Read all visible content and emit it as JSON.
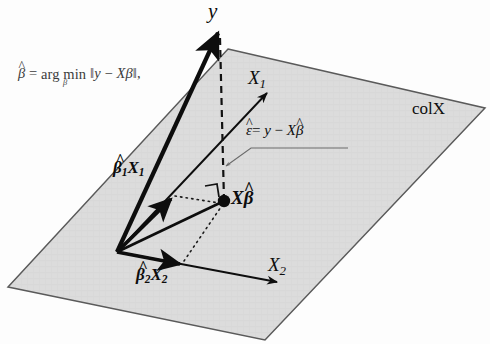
{
  "figure": {
    "background_color": "#fdfdfd",
    "plane_fill": "#dcdcdc",
    "plane_stroke": "#5a5a5a",
    "vector_color": "#0d0d0d"
  },
  "formula": {
    "lhs_beta": "β",
    "equals": "=",
    "operator": "arg min",
    "operator_subscript": "β",
    "norm_open": "‖",
    "norm_body_y": "y",
    "norm_minus": "−",
    "norm_body_xbeta": "Xβ",
    "norm_close": "‖",
    "trailing_comma": ",",
    "full_text": "β̂ = arg min_β ‖y − Xβ‖,"
  },
  "labels": {
    "y": "y",
    "x1": "X",
    "x1_sub": "1",
    "x2": "X",
    "x2_sub": "2",
    "beta1_x1_beta": "β",
    "beta1_x1_sub": "1",
    "beta1_x1_x": "X",
    "beta1_x1_xsub": "1",
    "beta2_x2_beta": "β",
    "beta2_x2_sub": "2",
    "beta2_x2_x": "X",
    "beta2_x2_xsub": "2",
    "xbeta_x": "X",
    "xbeta_beta": "β",
    "col_space": "colX",
    "residual_eps": "ε",
    "residual_equals": "=",
    "residual_y": "y",
    "residual_minus": "−",
    "residual_x": "X",
    "residual_beta": "β",
    "residual_full": "ε̂ = y − Xβ̂"
  },
  "geometry": {
    "plane_corners": [
      [
        228,
        49
      ],
      [
        485,
        108
      ],
      [
        265,
        340
      ],
      [
        8,
        287
      ]
    ],
    "origin": [
      117,
      252
    ],
    "projection_point": [
      224,
      201
    ],
    "y_arrow_tip": [
      218,
      31
    ],
    "x1_arrow_tip": [
      267,
      93
    ],
    "x2_arrow_tip": [
      277,
      282
    ],
    "b1x1_arrow_tip": [
      171,
      199
    ],
    "b2x2_arrow_tip": [
      180,
      264
    ],
    "dashed_line": [
      [
        224,
        201
      ],
      [
        220,
        40
      ]
    ],
    "right_angle_marker": true
  }
}
